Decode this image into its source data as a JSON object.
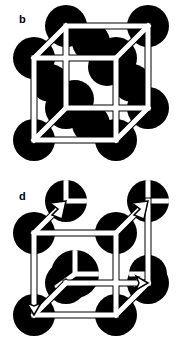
{
  "figure": {
    "kind": "crystal-structure-diagram",
    "background_color": "#ffffff",
    "atom_color": "#000000",
    "edge_fill_color": "#ffffff",
    "edge_stroke_color": "#000000",
    "width": 184,
    "height": 347
  },
  "panels": [
    {
      "id": "b",
      "label": "b",
      "label_x": 19,
      "label_y": 14,
      "structure": "face-centred-cubic",
      "description": "Face-centred cubic unit cell: solid black atoms at the eight cube corners and at the centre of each of the six faces, drawn behind an open white wireframe cube.",
      "atom_radius": 21,
      "atom_radius_face": 19,
      "cube": {
        "front_face": {
          "left": 34,
          "top": 58,
          "right": 116,
          "bottom": 140
        },
        "back_face": {
          "left": 66,
          "top": 26,
          "right": 148,
          "bottom": 108
        },
        "edge_width": 5,
        "stroke_width": 1
      },
      "atoms": [
        {
          "name": "corner-front-top-left",
          "x": 34,
          "y": 58,
          "r": 21,
          "type": "full"
        },
        {
          "name": "corner-front-top-right",
          "x": 116,
          "y": 58,
          "r": 21,
          "type": "full"
        },
        {
          "name": "corner-front-bottom-left",
          "x": 34,
          "y": 140,
          "r": 21,
          "type": "full"
        },
        {
          "name": "corner-front-bottom-right",
          "x": 116,
          "y": 140,
          "r": 21,
          "type": "full"
        },
        {
          "name": "corner-back-top-left",
          "x": 66,
          "y": 26,
          "r": 21,
          "type": "full"
        },
        {
          "name": "corner-back-top-right",
          "x": 148,
          "y": 26,
          "r": 21,
          "type": "full"
        },
        {
          "name": "corner-back-bottom-left",
          "x": 66,
          "y": 108,
          "r": 21,
          "type": "full"
        },
        {
          "name": "corner-back-bottom-right",
          "x": 148,
          "y": 108,
          "r": 21,
          "type": "full"
        },
        {
          "name": "face-centre-front",
          "x": 75,
          "y": 99,
          "r": 19,
          "type": "full"
        },
        {
          "name": "face-centre-back",
          "x": 107,
          "y": 67,
          "r": 19,
          "type": "full"
        },
        {
          "name": "face-centre-top",
          "x": 91,
          "y": 42,
          "r": 19,
          "type": "full"
        },
        {
          "name": "face-centre-bottom",
          "x": 91,
          "y": 124,
          "r": 19,
          "type": "full"
        },
        {
          "name": "face-centre-left",
          "x": 50,
          "y": 83,
          "r": 19,
          "type": "full"
        },
        {
          "name": "face-centre-right",
          "x": 132,
          "y": 83,
          "r": 19,
          "type": "full"
        }
      ],
      "arrows": []
    },
    {
      "id": "d",
      "label": "d",
      "label_x": 19,
      "label_y": 16,
      "structure": "cubic-cell-with-sectioned-atoms-and-axis-arrows",
      "description": "Cubic cell with black atoms at the corners, face centres and body centre; the body-centre atom and the right face atom are cut by white sectors, and white arrows with solid heads run along the two receding top edges and along the bottom edges.",
      "atom_radius": 21,
      "atom_radius_face": 19,
      "cube": {
        "front_face": {
          "left": 34,
          "top": 58,
          "right": 116,
          "bottom": 140
        },
        "back_face": {
          "left": 66,
          "top": 26,
          "right": 148,
          "bottom": 108
        },
        "edge_width": 5,
        "stroke_width": 1
      },
      "atoms": [
        {
          "name": "corner-front-top-left",
          "x": 34,
          "y": 58,
          "r": 21,
          "type": "full"
        },
        {
          "name": "corner-front-top-right",
          "x": 116,
          "y": 58,
          "r": 21,
          "type": "full"
        },
        {
          "name": "corner-front-bottom-left",
          "x": 34,
          "y": 140,
          "r": 21,
          "type": "full"
        },
        {
          "name": "corner-front-bottom-right",
          "x": 116,
          "y": 140,
          "r": 21,
          "type": "full"
        },
        {
          "name": "corner-back-top-left",
          "x": 66,
          "y": 26,
          "r": 21,
          "type": "sectored"
        },
        {
          "name": "corner-back-top-right",
          "x": 148,
          "y": 26,
          "r": 21,
          "type": "sectored"
        },
        {
          "name": "corner-back-bottom-left",
          "x": 66,
          "y": 108,
          "r": 21,
          "type": "full"
        },
        {
          "name": "corner-back-bottom-right",
          "x": 148,
          "y": 108,
          "r": 21,
          "type": "full"
        },
        {
          "name": "body-centre",
          "x": 75,
          "y": 99,
          "r": 24,
          "type": "three-sector"
        },
        {
          "name": "face-centre-right",
          "x": 148,
          "y": 99,
          "r": 19,
          "type": "notched"
        }
      ],
      "arrows": [
        {
          "name": "axis-arrow-left-rear",
          "from_x": 34,
          "from_y": 58,
          "to_x": 66,
          "to_y": 26
        },
        {
          "name": "axis-arrow-right-rear",
          "from_x": 116,
          "from_y": 58,
          "to_x": 148,
          "to_y": 26
        },
        {
          "name": "axis-arrow-bottom-left",
          "from_x": 66,
          "from_y": 108,
          "to_x": 34,
          "to_y": 140
        },
        {
          "name": "axis-arrow-bottom-right",
          "from_x": 116,
          "from_y": 140,
          "to_x": 148,
          "to_y": 108
        }
      ]
    }
  ]
}
